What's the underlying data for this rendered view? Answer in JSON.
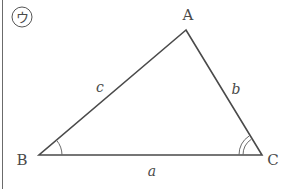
{
  "figure": {
    "badge_label": "ウ",
    "vertices": {
      "A": {
        "label": "A",
        "x": 186,
        "y": 30
      },
      "B": {
        "label": "B",
        "x": 39,
        "y": 155
      },
      "C": {
        "label": "C",
        "x": 262,
        "y": 155
      }
    },
    "sides": {
      "a": {
        "label": "a"
      },
      "b": {
        "label": "b"
      },
      "c": {
        "label": "c"
      }
    },
    "angle_marks": {
      "B": "single-arc",
      "C": "double-arc"
    },
    "colors": {
      "line": "#4a4a4a",
      "text": "#4a4a4a",
      "border": "#6b6b6b"
    }
  }
}
